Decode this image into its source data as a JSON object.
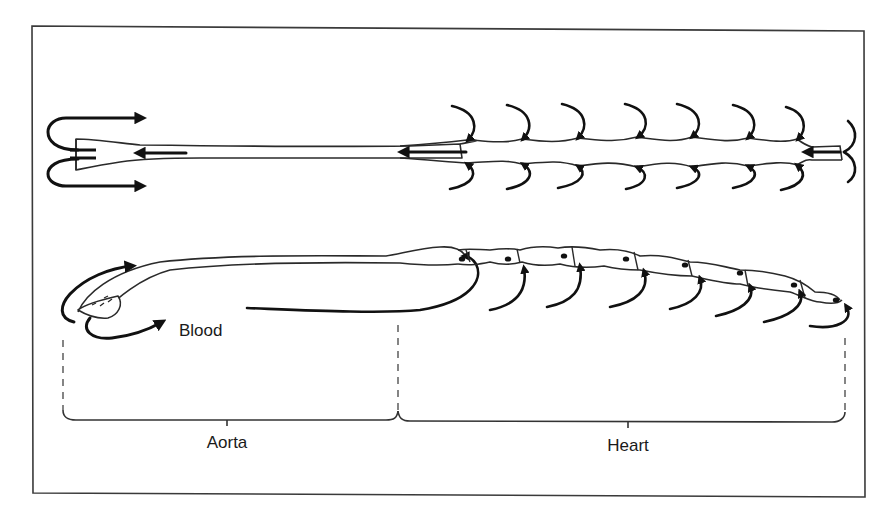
{
  "figure": {
    "labels": {
      "blood": "Blood",
      "aorta": "Aorta",
      "heart": "Heart"
    },
    "colors": {
      "stroke": "#111111",
      "frame": "#3a3a3a",
      "background": "#ffffff"
    },
    "views": [
      {
        "name": "dorsal-view",
        "description": "top view of dorsal vessel with paired ostia"
      },
      {
        "name": "lateral-view",
        "description": "side view of dorsal vessel"
      }
    ],
    "heart_chambers_top": 7,
    "heart_chambers_side": 8
  }
}
